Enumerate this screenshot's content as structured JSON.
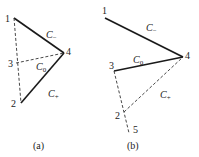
{
  "diagrams": [
    {
      "caption": "(a)",
      "points": {
        "1": "1",
        "2": "2",
        "3": "3",
        "4": "4"
      },
      "curves": {
        "minus": "C",
        "minus_sub": "−",
        "zero": "C",
        "zero_sub": "0",
        "plus": "C",
        "plus_sub": "+"
      }
    },
    {
      "caption": "(b)",
      "points": {
        "1": "1",
        "2": "2",
        "3": "3",
        "4": "4",
        "5": "5"
      },
      "curves": {
        "minus": "C",
        "minus_sub": "−",
        "zero": "C",
        "zero_sub": "0",
        "plus": "C",
        "plus_sub": "+"
      }
    }
  ],
  "colors": {
    "line": "#1a1a1a",
    "dash": "#333333"
  }
}
